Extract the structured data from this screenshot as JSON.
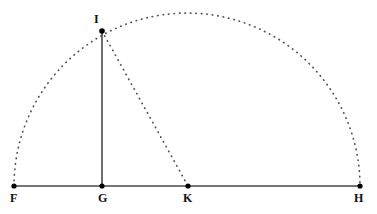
{
  "figure": {
    "type": "geometry-diagram",
    "canvas": {
      "width": 377,
      "height": 214,
      "background": "#ffffff"
    },
    "styles": {
      "solid_color": "#4a4a4a",
      "dotted_color": "#555555",
      "point_color": "#000000",
      "label_color": "#111111",
      "solid_width": 1.6,
      "dotted_width": 1.7,
      "dot_dash": "0.5 5"
    },
    "points": [
      {
        "id": "F",
        "label": "F",
        "x": 14,
        "y": 186,
        "label_x": 10,
        "label_y": 192,
        "radius": 2.6
      },
      {
        "id": "G",
        "label": "G",
        "x": 102,
        "y": 186,
        "label_x": 98,
        "label_y": 192,
        "radius": 2.6
      },
      {
        "id": "K",
        "label": "K",
        "x": 188,
        "y": 186,
        "label_x": 183,
        "label_y": 192,
        "radius": 2.6
      },
      {
        "id": "H",
        "label": "H",
        "x": 360,
        "y": 186,
        "label_x": 354,
        "label_y": 192,
        "radius": 2.6
      },
      {
        "id": "I",
        "label": "I",
        "x": 102,
        "y": 31,
        "label_x": 94,
        "label_y": 13,
        "radius": 2.8
      }
    ],
    "segments": [
      {
        "id": "FH",
        "from": "F",
        "to": "H",
        "style": "solid",
        "x1": 14,
        "y1": 186,
        "x2": 360,
        "y2": 186
      },
      {
        "id": "GI",
        "from": "G",
        "to": "I",
        "style": "solid",
        "x1": 102,
        "y1": 186,
        "x2": 102,
        "y2": 31
      },
      {
        "id": "IK",
        "from": "I",
        "to": "K",
        "style": "dotted",
        "x1": 102,
        "y1": 31,
        "x2": 188,
        "y2": 186
      }
    ],
    "arcs": [
      {
        "id": "semicircle-FH",
        "style": "dotted",
        "center_x": 187,
        "center_y": 186,
        "radius": 173,
        "start_x": 14,
        "start_y": 186,
        "end_x": 360,
        "end_y": 186,
        "sweep": "upper"
      }
    ]
  }
}
